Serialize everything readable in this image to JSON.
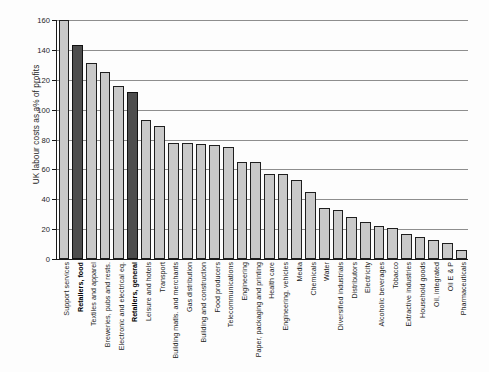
{
  "chart_data": {
    "type": "bar",
    "title": "",
    "subtitle": "",
    "xlabel": "",
    "ylabel": "UK labour costs as a% of profits",
    "ylim": [
      0,
      160
    ],
    "ytick_labels": [
      "0",
      "20",
      "40",
      "60",
      "80",
      "100",
      "120",
      "140",
      "160"
    ],
    "ytick_values": [
      0,
      20,
      40,
      60,
      80,
      100,
      120,
      140,
      160
    ],
    "grid": true,
    "legend": "none",
    "colors": {
      "bar_fill": "#c9c9c9",
      "bar_highlight_fill": "#4d4d4d",
      "bar_edge": "#1f1f1f",
      "gridline": "#8e8e8e",
      "axis": "#1a1a1a",
      "background": "#ffffff"
    },
    "categories": [
      "Support services",
      "Retailers, food",
      "Textiles and apparel",
      "Breweries, pubs and rests.",
      "Electronic and electrical eq.",
      "Retailers, general",
      "Leisure and hotels",
      "Transport",
      "Building matls. and merchants",
      "Gas distribution",
      "Building and construction",
      "Food producers",
      "Telecommunications",
      "Engineering",
      "Paper, packaging and printing",
      "Health care",
      "Engineering, vehicles",
      "Media",
      "Chemicals",
      "Water",
      "Diversified industrials",
      "Distributors",
      "Electricity",
      "Alcoholic beverages",
      "Tobacco",
      "Extractive industries",
      "Household goods",
      "Oil, integrated",
      "Oil E & P",
      "Pharmaceuticals"
    ],
    "values": [
      160,
      143,
      131,
      125,
      116,
      112,
      93,
      89,
      78,
      78,
      77,
      76,
      75,
      65,
      65,
      57,
      57,
      53,
      45,
      34,
      33,
      28,
      25,
      22,
      21,
      17,
      15,
      13,
      11,
      6
    ],
    "highlighted": [
      "Retailers, food",
      "Retailers, general"
    ]
  }
}
